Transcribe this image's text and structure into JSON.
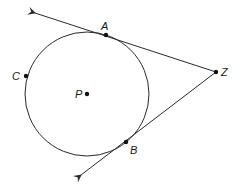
{
  "diagram": {
    "type": "geometry",
    "circle": {
      "center_label": "P",
      "cx": 87,
      "cy": 94,
      "r": 62
    },
    "points": {
      "A": {
        "label": "A",
        "x": 106,
        "y": 35
      },
      "B": {
        "label": "B",
        "x": 126,
        "y": 142
      },
      "C": {
        "label": "C",
        "x": 26,
        "y": 76
      },
      "P": {
        "label": "P",
        "x": 87,
        "y": 94
      },
      "Z": {
        "label": "Z",
        "x": 216,
        "y": 72
      }
    },
    "rays": [
      {
        "name": "ray-ZA",
        "from": "Z",
        "through": "A",
        "arrow_end": {
          "x": 33,
          "y": 12
        }
      },
      {
        "name": "ray-ZB",
        "from": "Z",
        "through": "B",
        "arrow_end": {
          "x": 80,
          "y": 176
        }
      }
    ],
    "colors": {
      "stroke": "#2a2a2a",
      "point": "#111111",
      "background": "#ffffff"
    }
  }
}
